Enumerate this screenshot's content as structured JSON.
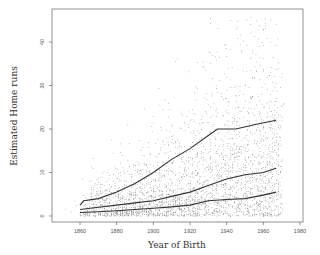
{
  "chart_data": {
    "type": "scatter",
    "title": "",
    "xlabel": "Year of Birth",
    "ylabel": "Estimated Home runs",
    "xlim": [
      1850,
      1980
    ],
    "ylim": [
      0,
      45
    ],
    "x_ticks": [
      1860,
      1880,
      1900,
      1920,
      1940,
      1960,
      1980
    ],
    "y_ticks": [
      0,
      10,
      20,
      30,
      40
    ],
    "grid": false,
    "legend": null,
    "scatter": {
      "description": "Dense scatter of individual players' estimated home runs vs. year of birth, spread increasing with year",
      "x_range": [
        1860,
        1970
      ],
      "approx_points": 3000
    },
    "series": [
      {
        "name": "upper quantile curve",
        "type": "line",
        "x": [
          1860,
          1862,
          1870,
          1880,
          1890,
          1900,
          1910,
          1920,
          1930,
          1935,
          1945,
          1955,
          1967
        ],
        "values": [
          2.5,
          3.5,
          4.0,
          5.5,
          7.5,
          10.0,
          13.0,
          15.5,
          18.5,
          20.0,
          20.0,
          21.0,
          22.0
        ]
      },
      {
        "name": "median curve",
        "type": "line",
        "x": [
          1860,
          1870,
          1880,
          1890,
          1900,
          1910,
          1920,
          1930,
          1940,
          1950,
          1960,
          1967
        ],
        "values": [
          1.5,
          2.0,
          2.5,
          3.0,
          3.5,
          4.5,
          5.5,
          7.0,
          8.5,
          9.5,
          10.0,
          11.0
        ]
      },
      {
        "name": "lower quantile curve",
        "type": "line",
        "x": [
          1860,
          1870,
          1880,
          1890,
          1900,
          1910,
          1920,
          1930,
          1940,
          1950,
          1960,
          1967
        ],
        "values": [
          0.8,
          1.0,
          1.2,
          1.5,
          1.8,
          2.1,
          2.5,
          3.5,
          3.8,
          4.0,
          4.8,
          5.5
        ]
      }
    ]
  },
  "layout": {
    "plot_left": 52,
    "plot_right": 303,
    "plot_top": 9,
    "plot_bottom": 222,
    "x0_year": 1860,
    "x0_px": 80,
    "px_per_year": 1.833,
    "y0_px": 216,
    "px_per_unit": 4.35
  }
}
